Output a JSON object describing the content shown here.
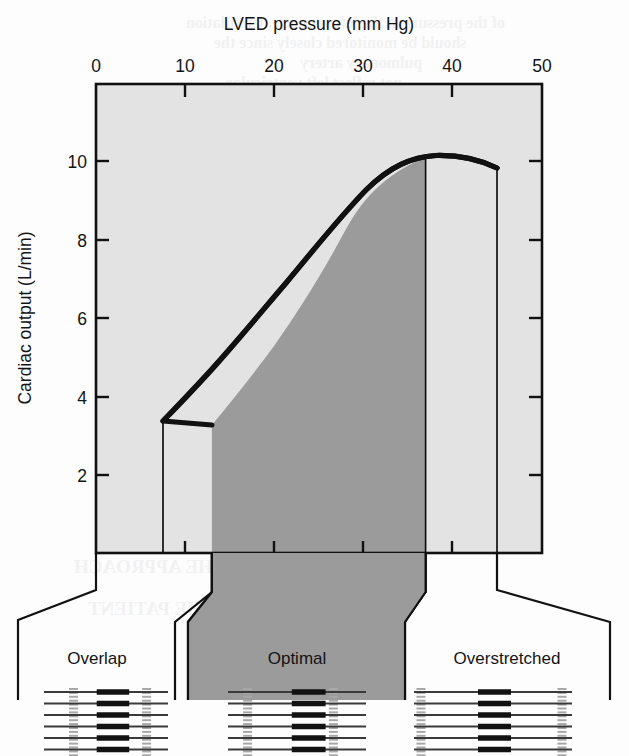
{
  "figure": {
    "title": "LVED pressure (mm Hg)",
    "ylabel": "Cardiac output (L/min)"
  },
  "colors": {
    "plot_background": "#e3e3e3",
    "optimal_band": "#9b9b9b",
    "curve": "#111111",
    "axis": "#111111",
    "zline": "#a8a8a8",
    "filament_thin": "#3a3a3a",
    "filament_thick": "#121212",
    "page": "#fdfdfd"
  },
  "zones": [
    {
      "id": "overlap",
      "label": "Overlap",
      "highlighted": false,
      "x_from": 0,
      "x_to": 13
    },
    {
      "id": "optimal",
      "label": "Optimal",
      "highlighted": true,
      "x_from": 13,
      "x_to": 37
    },
    {
      "id": "overstretched",
      "label": "Overstretched",
      "highlighted": false,
      "x_from": 37,
      "x_to": 50
    }
  ],
  "sarcomere_groups": [
    {
      "zone": "overlap",
      "n_zlines": 2,
      "myosin": true,
      "spacing": "narrow"
    },
    {
      "zone": "optimal",
      "n_zlines": 2,
      "myosin": true,
      "spacing": "medium"
    },
    {
      "zone": "overstretched",
      "n_zlines": 2,
      "myosin": true,
      "spacing": "wide"
    }
  ],
  "bleed_text": [
    {
      "text": "of the pressure in the left ventricle. Circulation",
      "x": 186,
      "y": 14
    },
    {
      "text": "should be monitored closely since the",
      "x": 214,
      "y": 34
    },
    {
      "text": "pulmonary artery",
      "x": 300,
      "y": 54
    },
    {
      "text": "not reflect left ventricular",
      "x": 226,
      "y": 74
    },
    {
      "text": "an indication of the circulatory",
      "x": 212,
      "y": 94
    },
    {
      "text": "PRESENTATION OF THE PATIENT",
      "x": 88,
      "y": 598
    },
    {
      "text": "PRESENTATION OF THE APPROACH",
      "x": 74,
      "y": 556
    }
  ],
  "chart_data": {
    "type": "line",
    "title": "LVED pressure (mm Hg)",
    "xlabel": "LVED pressure (mm Hg)",
    "ylabel": "Cardiac output (L/min)",
    "xlim": [
      0,
      50
    ],
    "ylim": [
      0.5,
      11.8
    ],
    "xticks": [
      0,
      10,
      20,
      30,
      40,
      50
    ],
    "yticks": [
      2,
      4,
      6,
      8,
      10
    ],
    "grid": false,
    "legend": "none",
    "series": [
      {
        "name": "Frank-Starling cardiac function curve",
        "x": [
          7.5,
          9,
          11,
          13,
          15,
          17,
          19,
          21,
          23,
          25,
          27,
          29,
          31,
          33,
          35,
          37,
          39,
          41,
          43,
          45
        ],
        "y": [
          3.3,
          3.85,
          4.55,
          5.25,
          5.95,
          6.62,
          7.25,
          7.85,
          8.38,
          8.86,
          9.28,
          9.62,
          9.86,
          10.02,
          10.1,
          10.13,
          10.12,
          10.05,
          9.95,
          9.82
        ]
      }
    ],
    "drop_lines": [
      {
        "x": 7.5,
        "y_top": 3.3,
        "y_bottom": 0.5,
        "note": "left end of curve"
      },
      {
        "x": 37,
        "y_top": 10.13,
        "y_bottom": 0.5,
        "note": "optimal / overstretched boundary"
      },
      {
        "x": 45,
        "y_top": 9.82,
        "y_bottom": 0.5,
        "note": "right end of curve"
      }
    ],
    "shaded_region": {
      "label": "Optimal",
      "x_from": 13,
      "x_to": 37,
      "color": "#9b9b9b"
    },
    "annotations": [
      {
        "text": "Overlap",
        "x_center": 6.5
      },
      {
        "text": "Optimal",
        "x_center": 25
      },
      {
        "text": "Overstretched",
        "x_center": 43.5
      }
    ]
  }
}
